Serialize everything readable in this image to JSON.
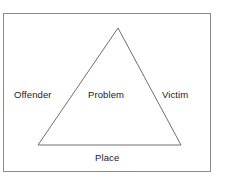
{
  "figure": {
    "type": "triangle-diagram",
    "background_color": "#ffffff",
    "frame": {
      "border_color": "#8a8a8a",
      "fill_color": "#ffffff"
    },
    "triangle": {
      "stroke_color": "#6e6e6e",
      "fill_color": "none",
      "apex": {
        "x": 118,
        "y": 28
      },
      "base_left": {
        "x": 38,
        "y": 145
      },
      "base_right": {
        "x": 181,
        "y": 145
      }
    },
    "labels": {
      "left_side": "Offender",
      "center": "Problem",
      "right_side": "Victim",
      "bottom": "Place"
    }
  }
}
